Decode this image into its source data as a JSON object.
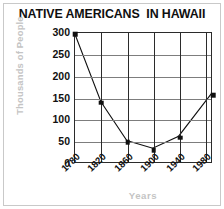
{
  "title": "NATIVE AMERICANS  IN HAWAII",
  "colors": {
    "line": "#101010",
    "marker": "#101010",
    "grid_horizontal": "#7d7d7d",
    "grid_vertical": "#2b2b2b",
    "axis_title": "#c4c4c4",
    "frame": "#c9c9c9",
    "text": "#111111",
    "background": "#ffffff"
  },
  "chart_data": {
    "type": "line",
    "title": "NATIVE AMERICANS  IN HAWAII",
    "xlabel": "Years",
    "ylabel": "Thousands of People",
    "x": [
      1780,
      1820,
      1860,
      1900,
      1940,
      1990
    ],
    "values": [
      297,
      140,
      50,
      32,
      60,
      158
    ],
    "series": [
      {
        "name": "Native Hawaiians",
        "values": [
          297,
          140,
          50,
          32,
          60,
          158
        ]
      }
    ],
    "xlim": [
      1780,
      1990
    ],
    "ylim": [
      0,
      300
    ],
    "xticks": [
      1780,
      1820,
      1860,
      1900,
      1940,
      1980
    ],
    "xtick_labels": [
      "1780",
      "1820",
      "1860",
      "1900",
      "1940",
      "1980"
    ],
    "yticks": [
      0,
      50,
      100,
      150,
      200,
      250,
      300
    ],
    "ytick_labels": [
      "0",
      "50",
      "100",
      "150",
      "200",
      "250",
      "300"
    ],
    "grid": true,
    "grid_axes": "both",
    "legend": false,
    "markers": "square"
  }
}
